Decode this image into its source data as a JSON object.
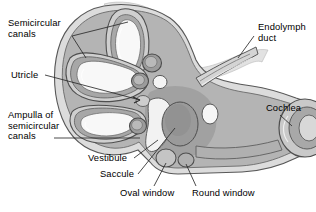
{
  "figure": {
    "type": "anatomical-diagram",
    "width": 316,
    "height": 212,
    "background_color": "#ffffff"
  },
  "palette": {
    "outline": "#3a3a3a",
    "bone_outer": "#d8d8d8",
    "bone_mid": "#bdbdbd",
    "perilymph": "#a8a8a8",
    "membranous": "#8f8f8f",
    "lumen_white": "#f7f7f7",
    "shadow": "#9a9a9a",
    "leader_line": "#2b2b2b",
    "text": "#000000"
  },
  "labels": [
    {
      "id": "semicircular-canals",
      "lines": [
        "Semicircular",
        "canals"
      ],
      "x": 8,
      "y": 18,
      "align": "left"
    },
    {
      "id": "utricle",
      "lines": [
        "Utricle"
      ],
      "x": 11,
      "y": 70,
      "align": "left"
    },
    {
      "id": "ampulla-of-semicircular-canals",
      "lines": [
        "Ampulla of",
        "semicircular",
        "canals"
      ],
      "x": 8,
      "y": 110,
      "align": "left"
    },
    {
      "id": "vestibule",
      "lines": [
        "Vestibule"
      ],
      "x": 88,
      "y": 155,
      "align": "left"
    },
    {
      "id": "saccule",
      "lines": [
        "Saccule"
      ],
      "x": 100,
      "y": 172,
      "align": "left"
    },
    {
      "id": "oval-window",
      "lines": [
        "Oval window"
      ],
      "x": 120,
      "y": 189,
      "align": "left"
    },
    {
      "id": "round-window",
      "lines": [
        "Round window"
      ],
      "x": 190,
      "y": 189,
      "align": "left"
    },
    {
      "id": "endolymph-duct",
      "lines": [
        "Endolymph",
        "duct"
      ],
      "x": 258,
      "y": 22,
      "align": "left"
    },
    {
      "id": "cochlea",
      "lines": [
        "Cochlea"
      ],
      "x": 268,
      "y": 104,
      "align": "left"
    }
  ],
  "structures": [
    {
      "id": "superior-semicircular-canal",
      "name": "Superior semicircular canal"
    },
    {
      "id": "lateral-semicircular-canal",
      "name": "Lateral semicircular canal"
    },
    {
      "id": "posterior-semicircular-canal",
      "name": "Posterior semicircular canal"
    },
    {
      "id": "utricle-body",
      "name": "Utricle"
    },
    {
      "id": "saccule-body",
      "name": "Saccule"
    },
    {
      "id": "vestibule-chamber",
      "name": "Vestibule"
    },
    {
      "id": "ampulla-1",
      "name": "Ampulla"
    },
    {
      "id": "ampulla-2",
      "name": "Ampulla"
    },
    {
      "id": "ampulla-3",
      "name": "Ampulla"
    },
    {
      "id": "endolymphatic-duct-tube",
      "name": "Endolymphatic duct"
    },
    {
      "id": "cochlea-spiral",
      "name": "Cochlea"
    },
    {
      "id": "oval-window-opening",
      "name": "Oval window"
    },
    {
      "id": "round-window-opening",
      "name": "Round window"
    }
  ]
}
